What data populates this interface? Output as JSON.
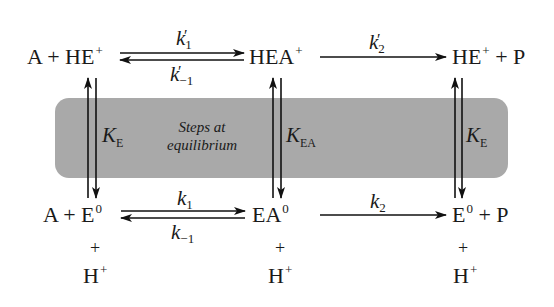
{
  "diagram": {
    "type": "enzyme-kinetics-scheme",
    "top_row": {
      "left": {
        "base": "A + HE",
        "charge": "+"
      },
      "middle": {
        "base": "HEA",
        "charge": "+"
      },
      "right": {
        "base": "HE",
        "charge": "+",
        "suffix": " + P"
      }
    },
    "bottom_row": {
      "left": {
        "base": "A + E",
        "charge": "0"
      },
      "middle": {
        "base": "EA",
        "charge": "0"
      },
      "right": {
        "base": "E",
        "charge": "0",
        "suffix": " + P"
      }
    },
    "proton_rows": {
      "plus": "+",
      "proton": {
        "base": "H",
        "charge": "+"
      }
    },
    "rate_constants": {
      "top_forward": {
        "symbol": "k",
        "prime": "′",
        "subscript": "1"
      },
      "top_reverse": {
        "symbol": "k",
        "prime": "′",
        "subscript": "−1"
      },
      "top_product": {
        "symbol": "k",
        "prime": "′",
        "subscript": "2"
      },
      "bottom_forward": {
        "symbol": "k",
        "subscript": "1"
      },
      "bottom_reverse": {
        "symbol": "k",
        "subscript": "−1"
      },
      "bottom_product": {
        "symbol": "k",
        "subscript": "2"
      }
    },
    "equilibrium_constants": {
      "left": {
        "symbol": "K",
        "subscript": "E"
      },
      "middle": {
        "symbol": "K",
        "subscript": "EA"
      },
      "right": {
        "symbol": "K",
        "subscript": "E"
      }
    },
    "equilibrium_box": {
      "label_line1": "Steps at",
      "label_line2": "equilibrium",
      "color": "#a9a9a9"
    }
  }
}
